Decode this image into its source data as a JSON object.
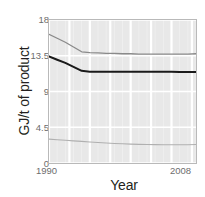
{
  "chart_data": {
    "type": "line",
    "title": "",
    "subtitle": "",
    "xlabel": "Year",
    "ylabel": "GJ/t of product",
    "xlim": [
      1990,
      2008
    ],
    "ylim": [
      0,
      18
    ],
    "xticks": [
      1990,
      2008
    ],
    "xticklabels": [
      "1990",
      "2008"
    ],
    "yticks": [
      0,
      4.5,
      9,
      13.5,
      18
    ],
    "yticklabels": [
      "0",
      "4.5",
      "9",
      "13.5",
      "18"
    ],
    "grid": true,
    "grid_color": "#ffffff",
    "plot_background": "#e8e8e8",
    "legend": false,
    "legend_position": "none",
    "x": [
      1990,
      1991,
      1992,
      1993,
      1994,
      1995,
      1996,
      1997,
      1998,
      1999,
      2000,
      2001,
      2002,
      2003,
      2004,
      2005,
      2006,
      2007,
      2008
    ],
    "series": [
      {
        "name": "upper",
        "color": "#8a8a8a",
        "width": 1.3,
        "values": [
          16.2,
          15.7,
          15.2,
          14.6,
          14.0,
          13.9,
          13.85,
          13.8,
          13.8,
          13.75,
          13.75,
          13.7,
          13.7,
          13.7,
          13.7,
          13.7,
          13.7,
          13.7,
          13.75
        ]
      },
      {
        "name": "middle",
        "color": "#1a1a1a",
        "width": 2.0,
        "values": [
          13.4,
          13.0,
          12.6,
          12.1,
          11.6,
          11.5,
          11.5,
          11.5,
          11.5,
          11.5,
          11.5,
          11.5,
          11.5,
          11.5,
          11.5,
          11.5,
          11.45,
          11.45,
          11.45
        ]
      },
      {
        "name": "lower",
        "color": "#b0b0b0",
        "width": 1.1,
        "values": [
          3.0,
          2.93,
          2.86,
          2.79,
          2.72,
          2.65,
          2.58,
          2.52,
          2.46,
          2.42,
          2.38,
          2.35,
          2.33,
          2.31,
          2.3,
          2.29,
          2.29,
          2.3,
          2.32
        ]
      }
    ]
  }
}
